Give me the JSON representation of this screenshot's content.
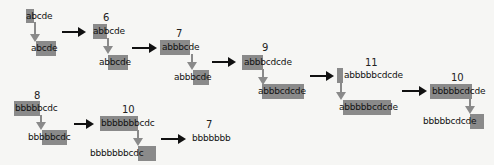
{
  "steps": [
    {
      "count": "",
      "top": "abcde",
      "bottom": "abcde"
    },
    {
      "count": "6",
      "top": "abbcde",
      "bottom": "abbcde"
    },
    {
      "count": "7",
      "top": "abbbcde",
      "bottom": "abbbcde"
    },
    {
      "count": "9",
      "top": "abbbcdcde",
      "bottom": "abbbcdcde"
    },
    {
      "count": "11",
      "top": "abbbbbcdcde",
      "bottom": "abbbbbcdcde"
    },
    {
      "count": "10",
      "top": "bbbbbcdcde",
      "bottom": "bbbbbcdcde"
    },
    {
      "count": "8",
      "top": "bbbbbcdc",
      "bottom": "bbbbbcdc"
    },
    {
      "count": "10",
      "top": "bbbbbbbcdc",
      "bottom": "bbbbbbbcdc"
    },
    {
      "count": "7",
      "top": "bbbbbbb",
      "bottom": ""
    }
  ],
  "colors": {
    "highlight": "#8a8a8a",
    "arrow": "#111111"
  }
}
